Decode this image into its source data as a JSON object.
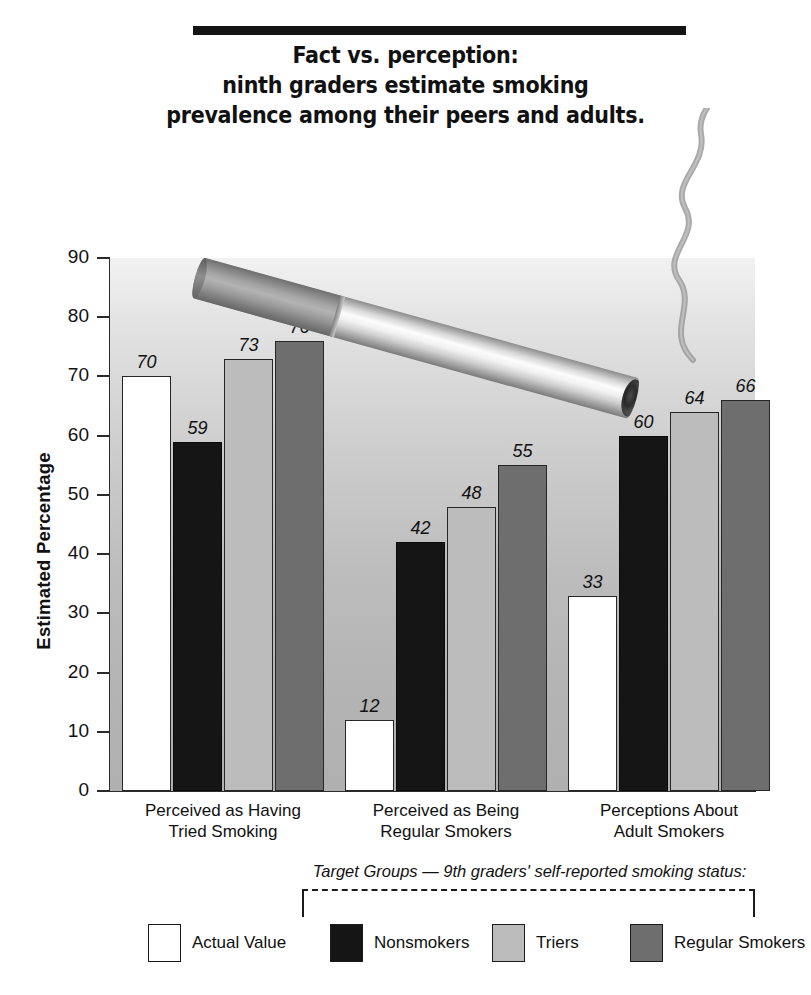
{
  "title": {
    "lines": [
      "Fact vs. perception:",
      "ninth graders estimate smoking",
      "prevalence among their peers and adults."
    ]
  },
  "chart_data": {
    "type": "bar",
    "title": "Fact vs. perception: ninth graders estimate smoking prevalence among their peers and adults.",
    "xlabel": "",
    "ylabel": "Estimated Percentage",
    "ylim": [
      0,
      90
    ],
    "yticks": [
      0,
      10,
      20,
      30,
      40,
      50,
      60,
      70,
      80,
      90
    ],
    "grid": false,
    "legend_position": "bottom",
    "categories": [
      "Perceived as Having Tried Smoking",
      "Perceived as Being Regular Smokers",
      "Perceptions About Adult Smokers"
    ],
    "category_lines": [
      [
        "Perceived as Having",
        "Tried Smoking"
      ],
      [
        "Perceived as Being",
        "Regular Smokers"
      ],
      [
        "Perceptions About",
        "Adult Smokers"
      ]
    ],
    "series": [
      {
        "name": "Actual Value",
        "color": "#ffffff",
        "values": [
          70,
          12,
          33
        ]
      },
      {
        "name": "Nonsmokers",
        "color": "#151515",
        "values": [
          59,
          42,
          60
        ]
      },
      {
        "name": "Triers",
        "color": "#bcbcbc",
        "values": [
          73,
          48,
          64
        ]
      },
      {
        "name": "Regular Smokers",
        "color": "#6e6e6e",
        "values": [
          76,
          55,
          66
        ]
      }
    ]
  },
  "legend": {
    "caption": "Target Groups — 9th graders' self-reported smoking status:",
    "items": [
      {
        "label": "Actual Value",
        "swatch": "white"
      },
      {
        "label": "Nonsmokers",
        "swatch": "black"
      },
      {
        "label": "Triers",
        "swatch": "ltgray"
      },
      {
        "label": "Regular Smokers",
        "swatch": "dkgray"
      }
    ]
  },
  "decoration": {
    "cigarette": "lit-cigarette-illustration",
    "smoke": "smoke-wisp"
  },
  "colors": {
    "actual_value": "#ffffff",
    "nonsmokers": "#151515",
    "triers": "#bcbcbc",
    "regular_smokers": "#6e6e6e",
    "plot_background_top": "#f2f2f2",
    "plot_background_bottom": "#b0b0b0",
    "ink": "#111111"
  }
}
